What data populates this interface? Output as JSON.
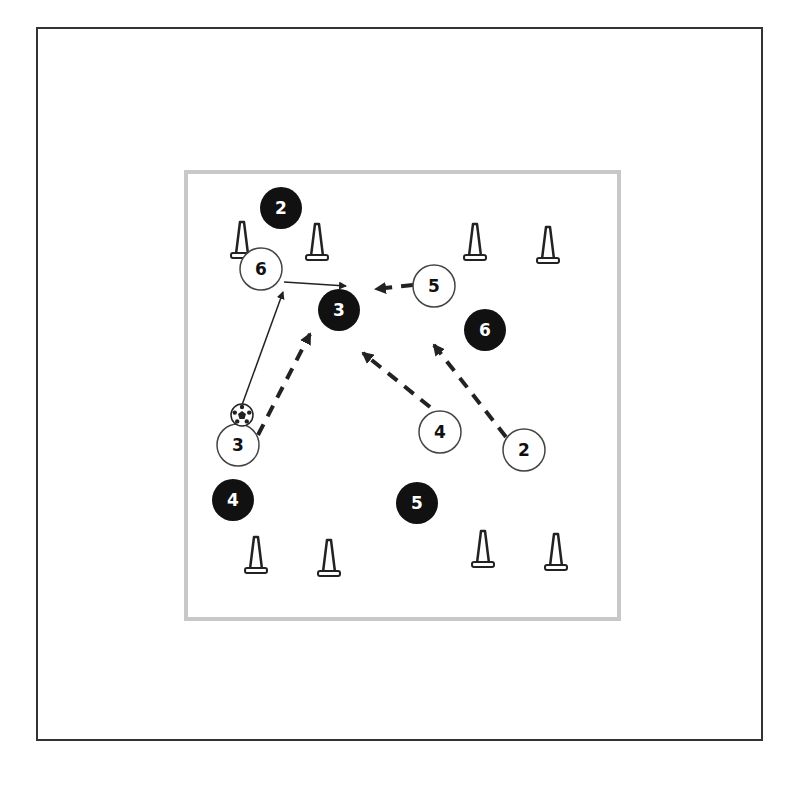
{
  "frame": {
    "x": 37,
    "y": 28,
    "w": 725,
    "h": 712,
    "stroke": "#333333"
  },
  "field": {
    "x": 186,
    "y": 172,
    "w": 433,
    "h": 447,
    "stroke": "#c8c8c8"
  },
  "colors": {
    "dark_player": "#111111",
    "light_player_fill": "#ffffff",
    "line": "#222222"
  },
  "dark_players": [
    {
      "label": "2",
      "x": 281,
      "y": 208
    },
    {
      "label": "3",
      "x": 339,
      "y": 310
    },
    {
      "label": "6",
      "x": 485,
      "y": 330
    },
    {
      "label": "4",
      "x": 233,
      "y": 500
    },
    {
      "label": "5",
      "x": 417,
      "y": 503
    }
  ],
  "light_players": [
    {
      "label": "6",
      "x": 261,
      "y": 269
    },
    {
      "label": "5",
      "x": 434,
      "y": 286
    },
    {
      "label": "4",
      "x": 440,
      "y": 432
    },
    {
      "label": "3",
      "x": 238,
      "y": 445
    },
    {
      "label": "2",
      "x": 524,
      "y": 450
    }
  ],
  "cones": [
    {
      "x": 242,
      "y": 255
    },
    {
      "x": 317,
      "y": 257
    },
    {
      "x": 475,
      "y": 257
    },
    {
      "x": 548,
      "y": 260
    },
    {
      "x": 256,
      "y": 570
    },
    {
      "x": 329,
      "y": 573
    },
    {
      "x": 483,
      "y": 564
    },
    {
      "x": 556,
      "y": 567
    }
  ],
  "ball": {
    "x": 242,
    "y": 415,
    "icon": "soccer-ball-icon"
  },
  "passes": [
    {
      "name": "pass-3-to-6",
      "x1": 242,
      "y1": 405,
      "x2": 283,
      "y2": 292
    },
    {
      "name": "pass-6-to-3",
      "x1": 284,
      "y1": 282,
      "x2": 346,
      "y2": 286
    }
  ],
  "runs": [
    {
      "name": "run-3",
      "x1": 258,
      "y1": 435,
      "x2": 310,
      "y2": 334
    },
    {
      "name": "run-5",
      "x1": 413,
      "y1": 285,
      "x2": 376,
      "y2": 289
    },
    {
      "name": "run-4",
      "x1": 430,
      "y1": 407,
      "x2": 363,
      "y2": 353
    },
    {
      "name": "run-2",
      "x1": 506,
      "y1": 437,
      "x2": 434,
      "y2": 345
    }
  ]
}
